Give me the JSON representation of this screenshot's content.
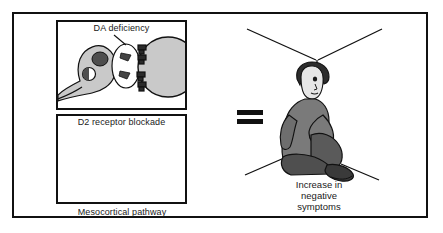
{
  "figure": {
    "colors": {
      "stroke": "#111111",
      "cell_fill": "#c9c9c9",
      "vesicle_fill": "#555555",
      "nucleus_fill": "#5a5a5a",
      "person_body": "#7a7a7a",
      "person_dark": "#4a4a4a",
      "background": "#ffffff"
    }
  },
  "left_panel": {
    "top_panel": {
      "caption": "DA deficiency",
      "name": "da-deficiency-panel"
    },
    "bottom_panel": {
      "caption": "D2 receptor blockade",
      "name": "d2-receptor-blockade-panel"
    },
    "pathway_label": "Mesocortical pathway"
  },
  "right_scene": {
    "equals_symbol": "=",
    "caption_lines": [
      "Increase in",
      "negative",
      "symptoms"
    ],
    "caption_line_1": "Increase in",
    "caption_line_2": "negative",
    "caption_line_3": "symptoms",
    "person_description": "seated-withdrawn-person"
  }
}
